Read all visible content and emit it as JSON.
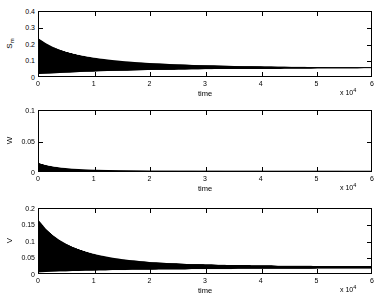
{
  "figure": {
    "background": "#ffffff",
    "line_color": "#000000",
    "axis_color": "#000000"
  },
  "chart_data": [
    {
      "type": "line",
      "title": "",
      "xlabel": "time",
      "ylabel": "S_m",
      "ylabel_base": "S",
      "ylabel_sub": "m",
      "xlim": [
        0,
        6
      ],
      "ylim": [
        0,
        0.4
      ],
      "x_multiplier": "x 10",
      "x_multiplier_exp": "4",
      "xticks": [
        0,
        1,
        2,
        3,
        4,
        5,
        6
      ],
      "xticklabels": [
        "0",
        "1",
        "2",
        "3",
        "4",
        "5",
        "6"
      ],
      "yticks": [
        0,
        0.1,
        0.2,
        0.3,
        0.4
      ],
      "yticklabels": [
        "0",
        "0.1",
        "0.2",
        "0.3",
        "0.4"
      ],
      "grid": false,
      "legend": null,
      "description": "Damped oscillation: dense high-frequency band whose envelope starts near 0.23 at t=0 and decays toward a narrow steady band around 0.05",
      "envelope_upper": [
        0.232,
        0.205,
        0.183,
        0.166,
        0.152,
        0.141,
        0.131,
        0.123,
        0.116,
        0.11,
        0.105,
        0.1,
        0.096,
        0.092,
        0.089,
        0.086,
        0.083,
        0.081,
        0.079,
        0.077,
        0.075,
        0.073,
        0.072,
        0.07,
        0.069,
        0.068,
        0.067,
        0.066,
        0.065,
        0.064,
        0.063,
        0.062,
        0.062,
        0.061,
        0.06,
        0.06,
        0.059,
        0.059,
        0.058,
        0.058,
        0.058,
        0.057,
        0.057,
        0.057,
        0.056,
        0.056,
        0.056,
        0.056,
        0.055,
        0.055,
        0.055
      ],
      "envelope_lower": [
        0.012,
        0.014,
        0.016,
        0.018,
        0.02,
        0.022,
        0.024,
        0.026,
        0.027,
        0.029,
        0.03,
        0.031,
        0.032,
        0.033,
        0.034,
        0.035,
        0.036,
        0.037,
        0.038,
        0.038,
        0.039,
        0.04,
        0.04,
        0.041,
        0.041,
        0.042,
        0.042,
        0.043,
        0.043,
        0.043,
        0.044,
        0.044,
        0.044,
        0.045,
        0.045,
        0.045,
        0.045,
        0.046,
        0.046,
        0.046,
        0.046,
        0.046,
        0.047,
        0.047,
        0.047,
        0.047,
        0.047,
        0.047,
        0.047,
        0.048,
        0.048
      ],
      "envelope_x": [
        0,
        0.12,
        0.24,
        0.36,
        0.48,
        0.6,
        0.72,
        0.84,
        0.96,
        1.08,
        1.2,
        1.32,
        1.44,
        1.56,
        1.68,
        1.8,
        1.92,
        2.04,
        2.16,
        2.28,
        2.4,
        2.52,
        2.64,
        2.76,
        2.88,
        3.0,
        3.12,
        3.24,
        3.36,
        3.48,
        3.6,
        3.72,
        3.84,
        3.96,
        4.08,
        4.2,
        4.32,
        4.44,
        4.56,
        4.68,
        4.8,
        4.92,
        5.04,
        5.16,
        5.28,
        5.4,
        5.52,
        5.64,
        5.76,
        5.88,
        6.0
      ]
    },
    {
      "type": "line",
      "title": "",
      "xlabel": "time",
      "ylabel": "W",
      "ylabel_base": "W",
      "ylabel_sub": "",
      "xlim": [
        0,
        6
      ],
      "ylim": [
        0,
        0.1
      ],
      "x_multiplier": "x 10",
      "x_multiplier_exp": "4",
      "xticks": [
        0,
        1,
        2,
        3,
        4,
        5,
        6
      ],
      "xticklabels": [
        "0",
        "1",
        "2",
        "3",
        "4",
        "5",
        "6"
      ],
      "yticks": [
        0,
        0.05,
        0.1
      ],
      "yticklabels": [
        "0",
        "0.05",
        "0.1"
      ],
      "grid": false,
      "legend": null,
      "description": "Small transient spike reaching about 0.012 at t=0 that decays rapidly toward zero within the first unit of time, then remains flat at the baseline",
      "envelope_upper": [
        0.013,
        0.0098,
        0.0076,
        0.006,
        0.0048,
        0.0039,
        0.0032,
        0.0027,
        0.0023,
        0.002,
        0.0017,
        0.0015,
        0.0013,
        0.0012,
        0.0011,
        0.001,
        0.0009,
        0.0008,
        0.0008,
        0.0007,
        0.0007,
        0.0006,
        0.0006,
        0.0006,
        0.0005,
        0.0005,
        0.0005,
        0.0005,
        0.0004,
        0.0004,
        0.0004,
        0.0004,
        0.0004,
        0.0004,
        0.0003,
        0.0003,
        0.0003,
        0.0003,
        0.0003,
        0.0003,
        0.0003,
        0.0003,
        0.0003,
        0.0003,
        0.0003,
        0.0003,
        0.0002,
        0.0002,
        0.0002,
        0.0002,
        0.0002
      ],
      "envelope_lower": [
        0.0,
        0.0,
        0.0,
        0.0,
        0.0,
        0.0,
        0.0,
        0.0,
        0.0,
        0.0,
        0.0,
        0.0,
        0.0,
        0.0,
        0.0,
        0.0,
        0.0,
        0.0,
        0.0,
        0.0,
        0.0,
        0.0,
        0.0,
        0.0,
        0.0,
        0.0,
        0.0,
        0.0,
        0.0,
        0.0,
        0.0,
        0.0,
        0.0,
        0.0,
        0.0,
        0.0,
        0.0,
        0.0,
        0.0,
        0.0,
        0.0,
        0.0,
        0.0,
        0.0,
        0.0,
        0.0,
        0.0,
        0.0,
        0.0,
        0.0,
        0.0
      ],
      "envelope_x": [
        0,
        0.12,
        0.24,
        0.36,
        0.48,
        0.6,
        0.72,
        0.84,
        0.96,
        1.08,
        1.2,
        1.32,
        1.44,
        1.56,
        1.68,
        1.8,
        1.92,
        2.04,
        2.16,
        2.28,
        2.4,
        2.52,
        2.64,
        2.76,
        2.88,
        3.0,
        3.12,
        3.24,
        3.36,
        3.48,
        3.6,
        3.72,
        3.84,
        3.96,
        4.08,
        4.2,
        4.32,
        4.44,
        4.56,
        4.68,
        4.8,
        4.92,
        5.04,
        5.16,
        5.28,
        5.4,
        5.52,
        5.64,
        5.76,
        5.88,
        6.0
      ]
    },
    {
      "type": "line",
      "title": "",
      "xlabel": "time",
      "ylabel": "V",
      "ylabel_base": "V",
      "ylabel_sub": "",
      "xlim": [
        0,
        6
      ],
      "ylim": [
        0,
        0.2
      ],
      "x_multiplier": "x 10",
      "x_multiplier_exp": "4",
      "xticks": [
        0,
        1,
        2,
        3,
        4,
        5,
        6
      ],
      "xticklabels": [
        "0",
        "1",
        "2",
        "3",
        "4",
        "5",
        "6"
      ],
      "yticks": [
        0,
        0.05,
        0.1,
        0.15,
        0.2
      ],
      "yticklabels": [
        "0",
        "0.05",
        "0.1",
        "0.15",
        "0.2"
      ],
      "grid": false,
      "legend": null,
      "description": "Damped oscillation: dense band with envelope peaking near 0.16 at t=0, decaying to a thin steady band around 0.02",
      "envelope_upper": [
        0.163,
        0.138,
        0.119,
        0.104,
        0.092,
        0.082,
        0.074,
        0.067,
        0.061,
        0.056,
        0.052,
        0.048,
        0.045,
        0.042,
        0.04,
        0.038,
        0.036,
        0.034,
        0.033,
        0.032,
        0.031,
        0.03,
        0.029,
        0.028,
        0.028,
        0.027,
        0.027,
        0.026,
        0.026,
        0.025,
        0.025,
        0.025,
        0.024,
        0.024,
        0.024,
        0.024,
        0.023,
        0.023,
        0.023,
        0.023,
        0.023,
        0.023,
        0.022,
        0.022,
        0.022,
        0.022,
        0.022,
        0.022,
        0.022,
        0.022,
        0.022
      ],
      "envelope_lower": [
        0.002,
        0.003,
        0.004,
        0.005,
        0.005,
        0.006,
        0.006,
        0.007,
        0.007,
        0.008,
        0.008,
        0.009,
        0.009,
        0.009,
        0.01,
        0.01,
        0.01,
        0.01,
        0.011,
        0.011,
        0.011,
        0.011,
        0.011,
        0.012,
        0.012,
        0.012,
        0.012,
        0.012,
        0.012,
        0.012,
        0.013,
        0.013,
        0.013,
        0.013,
        0.013,
        0.013,
        0.013,
        0.013,
        0.013,
        0.013,
        0.013,
        0.013,
        0.014,
        0.014,
        0.014,
        0.014,
        0.014,
        0.014,
        0.014,
        0.014,
        0.014
      ],
      "envelope_x": [
        0,
        0.12,
        0.24,
        0.36,
        0.48,
        0.6,
        0.72,
        0.84,
        0.96,
        1.08,
        1.2,
        1.32,
        1.44,
        1.56,
        1.68,
        1.8,
        1.92,
        2.04,
        2.16,
        2.28,
        2.4,
        2.52,
        2.64,
        2.76,
        2.88,
        3.0,
        3.12,
        3.24,
        3.36,
        3.48,
        3.6,
        3.72,
        3.84,
        3.96,
        4.08,
        4.2,
        4.32,
        4.44,
        4.56,
        4.68,
        4.8,
        4.92,
        5.04,
        5.16,
        5.28,
        5.4,
        5.52,
        5.64,
        5.76,
        5.88,
        6.0
      ]
    }
  ]
}
